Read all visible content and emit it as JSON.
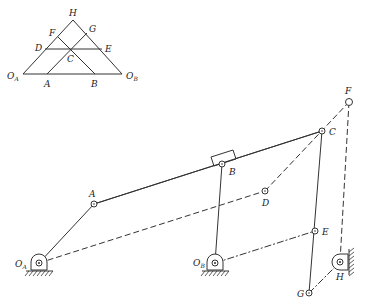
{
  "inset_diagram": {
    "title": "",
    "labels": {
      "H": "H",
      "F": "F",
      "G": "G",
      "D": "D",
      "E": "E",
      "C": "C",
      "OA": "O",
      "OA_sub": "A",
      "A": "A",
      "B": "B",
      "OB": "O",
      "OB_sub": "B"
    },
    "points": {
      "OA": [
        23,
        74
      ],
      "OB": [
        122,
        74
      ],
      "H": [
        73,
        20
      ],
      "A": [
        47,
        74
      ],
      "B": [
        95,
        74
      ],
      "D": [
        45,
        49
      ],
      "E": [
        102,
        49
      ],
      "C": [
        71,
        49
      ],
      "F": [
        58,
        37
      ],
      "G": [
        87,
        33
      ]
    }
  },
  "mechanism": {
    "labels": {
      "OA": "O",
      "OA_sub": "A",
      "OB": "O",
      "OB_sub": "B",
      "A": "A",
      "B": "B",
      "C": "C",
      "D": "D",
      "E": "E",
      "F": "F",
      "G": "G",
      "H": "H"
    },
    "joints": {
      "OA": [
        39,
        263
      ],
      "A": [
        94,
        204
      ],
      "B": [
        222,
        164
      ],
      "C": [
        322,
        131
      ],
      "D": [
        265,
        191
      ],
      "OB": [
        215,
        263
      ],
      "E": [
        315,
        231
      ],
      "F": [
        349,
        102
      ],
      "G": [
        309,
        293
      ],
      "H": [
        340,
        262
      ]
    },
    "links": [
      {
        "from": "OA",
        "to": "A",
        "style": "solid"
      },
      {
        "from": "A",
        "to": "C",
        "style": "solid"
      },
      {
        "from": "OB",
        "to": "B",
        "style": "solid"
      },
      {
        "from": "C",
        "to": "G",
        "style": "solid"
      },
      {
        "from": "OA",
        "to": "D",
        "style": "dashed"
      },
      {
        "from": "D",
        "to": "F",
        "style": "dashed"
      },
      {
        "from": "F",
        "to": "H",
        "style": "dashed"
      },
      {
        "from": "OB",
        "to": "E",
        "style": "dashdot"
      },
      {
        "from": "G",
        "to": "H",
        "style": "dashdot"
      }
    ],
    "ground_pivots": [
      "OA",
      "OB",
      "H"
    ],
    "slider": {
      "at": "B",
      "on_link": "A-C"
    }
  }
}
